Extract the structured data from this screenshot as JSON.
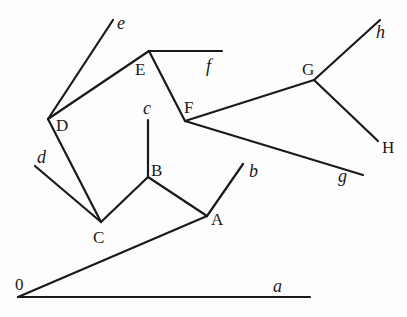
{
  "diagram": {
    "type": "tree",
    "stroke_color": "#1a1a1a",
    "background": "#fdfdfd",
    "nodes": [
      {
        "id": "0",
        "label": "0",
        "x": 18,
        "y": 297,
        "lx": 15,
        "ly": 290,
        "kind": "internal"
      },
      {
        "id": "A",
        "label": "A",
        "x": 207,
        "y": 216,
        "lx": 211,
        "ly": 225,
        "kind": "internal"
      },
      {
        "id": "B",
        "label": "B",
        "x": 148,
        "y": 177,
        "lx": 151,
        "ly": 176,
        "kind": "internal"
      },
      {
        "id": "C",
        "label": "C",
        "x": 101,
        "y": 222,
        "lx": 93,
        "ly": 243,
        "kind": "internal"
      },
      {
        "id": "D",
        "label": "D",
        "x": 48,
        "y": 119,
        "lx": 56,
        "ly": 131,
        "kind": "internal"
      },
      {
        "id": "E",
        "label": "E",
        "x": 149,
        "y": 51,
        "lx": 135,
        "ly": 75,
        "kind": "internal"
      },
      {
        "id": "F",
        "label": "F",
        "x": 185,
        "y": 121,
        "lx": 184,
        "ly": 113,
        "kind": "internal"
      },
      {
        "id": "G",
        "label": "G",
        "x": 314,
        "y": 80,
        "lx": 302,
        "ly": 75,
        "kind": "internal"
      },
      {
        "id": "H",
        "label": "H",
        "x": 378,
        "y": 141,
        "lx": 382,
        "ly": 153,
        "kind": "leaf-upper"
      },
      {
        "id": "a",
        "label": "a",
        "x": 310,
        "y": 297,
        "lx": 273,
        "ly": 292,
        "kind": "leaf"
      },
      {
        "id": "b",
        "label": "b",
        "x": 243,
        "y": 164,
        "lx": 249,
        "ly": 177,
        "kind": "leaf"
      },
      {
        "id": "c",
        "label": "c",
        "x": 148,
        "y": 120,
        "lx": 143,
        "ly": 114,
        "kind": "leaf"
      },
      {
        "id": "d",
        "label": "d",
        "x": 35,
        "y": 166,
        "lx": 37,
        "ly": 163,
        "kind": "leaf"
      },
      {
        "id": "e",
        "label": "e",
        "x": 113,
        "y": 20,
        "lx": 117,
        "ly": 29,
        "kind": "leaf"
      },
      {
        "id": "f",
        "label": "f",
        "x": 222,
        "y": 51,
        "lx": 206,
        "ly": 72,
        "kind": "leaf"
      },
      {
        "id": "g",
        "label": "g",
        "x": 363,
        "y": 175,
        "lx": 338,
        "ly": 182,
        "kind": "leaf"
      },
      {
        "id": "h",
        "label": "h",
        "x": 380,
        "y": 20,
        "lx": 376,
        "ly": 38,
        "kind": "leaf"
      }
    ],
    "edges": [
      [
        "0",
        "a"
      ],
      [
        "0",
        "A"
      ],
      [
        "A",
        "b"
      ],
      [
        "A",
        "B"
      ],
      [
        "B",
        "c"
      ],
      [
        "B",
        "C"
      ],
      [
        "C",
        "d"
      ],
      [
        "C",
        "D"
      ],
      [
        "D",
        "e"
      ],
      [
        "D",
        "E"
      ],
      [
        "E",
        "f"
      ],
      [
        "E",
        "F"
      ],
      [
        "F",
        "g"
      ],
      [
        "F",
        "G"
      ],
      [
        "G",
        "h"
      ],
      [
        "G",
        "H"
      ]
    ]
  }
}
